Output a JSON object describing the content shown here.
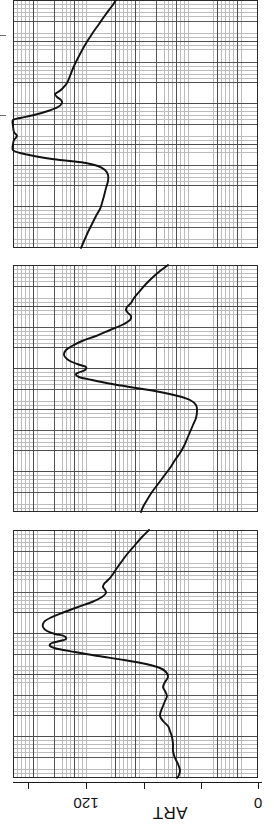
{
  "figure": {
    "kind": "physiologic-waveform-strip",
    "signal_label": "ART",
    "orientation_note": "chart rotated 90 degrees; labels read sideways",
    "panel_count": 3
  },
  "axis": {
    "title": "ART",
    "ticks": [
      {
        "value": "",
        "x": 28,
        "labeled": false
      },
      {
        "value": "120",
        "x": 86,
        "labeled": true
      },
      {
        "value": "",
        "x": 144,
        "labeled": false
      },
      {
        "value": "",
        "x": 201,
        "labeled": false
      },
      {
        "value": "0",
        "x": 258,
        "labeled": true
      }
    ],
    "labels": {
      "upper": "120",
      "lower": "0"
    },
    "line_color": "#1a1a1a"
  },
  "colors": {
    "trace": "#111111",
    "grid_fine": "#b9b9b9",
    "grid_major": "#3a3a3a",
    "background": "#ffffff",
    "border": "#2a2a2a"
  },
  "chart_data": {
    "type": "line",
    "title": "",
    "subtitle": "",
    "xlabel": "",
    "ylabel": "ART",
    "ylim": [
      0,
      180
    ],
    "grid": true,
    "legend": null,
    "annotations": [],
    "axis_tick_labels": [
      "120",
      "0"
    ],
    "note": "Arterial pressure (ART) tracing on ruled chart paper, three consecutive strips; image is rotated 90 degrees so time runs down the page and pressure runs right-to-left (0 at right edge, 120 at x=86).",
    "panels": [
      {
        "name": "strip-1",
        "box": {
          "x": 13,
          "y": 0,
          "w": 245,
          "h": 248
        },
        "series": [
          {
            "name": "ART",
            "points": [
              [
                116,
                0
              ],
              [
                112,
                6
              ],
              [
                106,
                14
              ],
              [
                99,
                24
              ],
              [
                92,
                34
              ],
              [
                85,
                45
              ],
              [
                79,
                56
              ],
              [
                74,
                66
              ],
              [
                70,
                76
              ],
              [
                67,
                83
              ],
              [
                62,
                89
              ],
              [
                58,
                92
              ],
              [
                55,
                94
              ],
              [
                57,
                97
              ],
              [
                61,
                100
              ],
              [
                62,
                103
              ],
              [
                58,
                107
              ],
              [
                48,
                111
              ],
              [
                34,
                115
              ],
              [
                20,
                118
              ],
              [
                13,
                120
              ],
              [
                13,
                126
              ],
              [
                14,
                132
              ],
              [
                17,
                136
              ],
              [
                14,
                140
              ],
              [
                13,
                144
              ],
              [
                13,
                150
              ],
              [
                20,
                153
              ],
              [
                34,
                156
              ],
              [
                52,
                159
              ],
              [
                70,
                161
              ],
              [
                86,
                163
              ],
              [
                98,
                166
              ],
              [
                105,
                170
              ],
              [
                108,
                175
              ],
              [
                108,
                181
              ],
              [
                106,
                188
              ],
              [
                104,
                196
              ],
              [
                102,
                203
              ],
              [
                100,
                209
              ],
              [
                96,
                216
              ],
              [
                92,
                224
              ],
              [
                88,
                232
              ],
              [
                84,
                241
              ],
              [
                81,
                248
              ]
            ],
            "direction": "top-to-bottom"
          }
        ]
      },
      {
        "name": "strip-2",
        "box": {
          "x": 13,
          "y": 265,
          "w": 245,
          "h": 247
        },
        "series": [
          {
            "name": "ART",
            "points": [
              [
                168,
                265
              ],
              [
                160,
                271
              ],
              [
                152,
                278
              ],
              [
                145,
                285
              ],
              [
                139,
                292
              ],
              [
                134,
                298
              ],
              [
                131,
                303
              ],
              [
                127,
                307
              ],
              [
                126,
                310
              ],
              [
                128,
                313
              ],
              [
                131,
                316
              ],
              [
                130,
                320
              ],
              [
                122,
                325
              ],
              [
                110,
                330
              ],
              [
                96,
                336
              ],
              [
                82,
                341
              ],
              [
                72,
                346
              ],
              [
                66,
                350
              ],
              [
                64,
                355
              ],
              [
                67,
                359
              ],
              [
                72,
                362
              ],
              [
                80,
                365
              ],
              [
                86,
                367
              ],
              [
                85,
                370
              ],
              [
                80,
                372
              ],
              [
                76,
                374
              ],
              [
                79,
                377
              ],
              [
                92,
                380
              ],
              [
                112,
                384
              ],
              [
                136,
                388
              ],
              [
                160,
                392
              ],
              [
                178,
                396
              ],
              [
                190,
                400
              ],
              [
                196,
                405
              ],
              [
                197,
                411
              ],
              [
                196,
                418
              ],
              [
                193,
                425
              ],
              [
                190,
                432
              ],
              [
                187,
                439
              ],
              [
                184,
                446
              ],
              [
                180,
                453
              ],
              [
                175,
                460
              ],
              [
                170,
                468
              ],
              [
                164,
                476
              ],
              [
                158,
                484
              ],
              [
                152,
                492
              ],
              [
                147,
                500
              ],
              [
                143,
                507
              ],
              [
                141,
                512
              ]
            ],
            "direction": "top-to-bottom"
          }
        ]
      },
      {
        "name": "strip-3",
        "box": {
          "x": 13,
          "y": 530,
          "w": 245,
          "h": 248
        },
        "series": [
          {
            "name": "ART",
            "points": [
              [
                149,
                530
              ],
              [
                142,
                537
              ],
              [
                135,
                545
              ],
              [
                128,
                553
              ],
              [
                122,
                561
              ],
              [
                117,
                568
              ],
              [
                113,
                574
              ],
              [
                110,
                578
              ],
              [
                107,
                581
              ],
              [
                104,
                584
              ],
              [
                103,
                587
              ],
              [
                105,
                590
              ],
              [
                106,
                593
              ],
              [
                102,
                597
              ],
              [
                92,
                602
              ],
              [
                78,
                607
              ],
              [
                62,
                613
              ],
              [
                50,
                618
              ],
              [
                44,
                622
              ],
              [
                43,
                627
              ],
              [
                47,
                631
              ],
              [
                55,
                634
              ],
              [
                64,
                636
              ],
              [
                66,
                639
              ],
              [
                60,
                641
              ],
              [
                52,
                643
              ],
              [
                50,
                646
              ],
              [
                58,
                649
              ],
              [
                75,
                652
              ],
              [
                98,
                656
              ],
              [
                124,
                660
              ],
              [
                146,
                664
              ],
              [
                160,
                668
              ],
              [
                166,
                672
              ],
              [
                168,
                677
              ],
              [
                165,
                682
              ],
              [
                163,
                687
              ],
              [
                165,
                691
              ],
              [
                167,
                696
              ],
              [
                165,
                701
              ],
              [
                163,
                706
              ],
              [
                161,
                711
              ],
              [
                160,
                716
              ],
              [
                163,
                721
              ],
              [
                168,
                726
              ],
              [
                170,
                731
              ],
              [
                172,
                737
              ],
              [
                173,
                744
              ],
              [
                173,
                751
              ],
              [
                175,
                758
              ],
              [
                178,
                764
              ],
              [
                180,
                770
              ],
              [
                179,
                775
              ],
              [
                177,
                778
              ]
            ],
            "direction": "top-to-bottom"
          }
        ]
      }
    ]
  }
}
